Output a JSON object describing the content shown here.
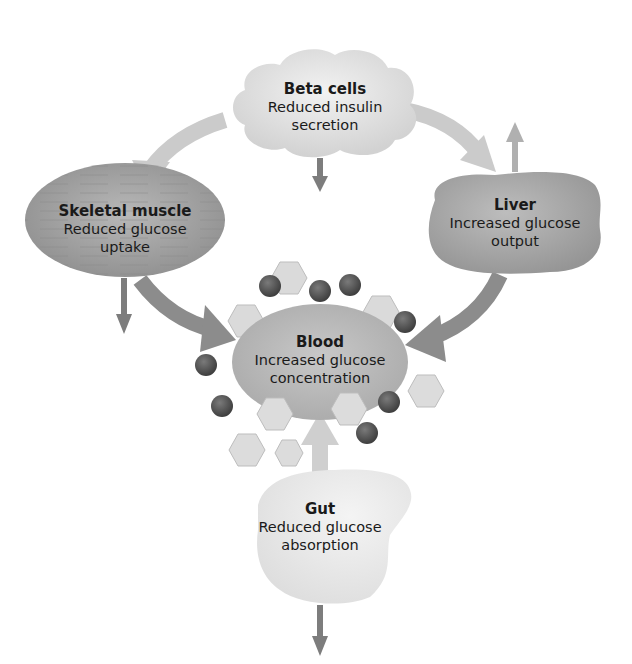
{
  "diagram": {
    "nodes": {
      "beta_cells": {
        "title": "Beta cells",
        "desc_line1": "Reduced insulin",
        "desc_line2": "secretion"
      },
      "skeletal_muscle": {
        "title": "Skeletal muscle",
        "desc_line1": "Reduced glucose",
        "desc_line2": "uptake"
      },
      "liver": {
        "title": "Liver",
        "desc_line1": "Increased glucose",
        "desc_line2": "output"
      },
      "blood": {
        "title": "Blood",
        "desc_line1": "Increased glucose",
        "desc_line2": "concentration"
      },
      "gut": {
        "title": "Gut",
        "desc_line1": "Reduced glucose",
        "desc_line2": "absorption"
      }
    },
    "edges": [
      {
        "from": "beta_cells",
        "to": "skeletal_muscle"
      },
      {
        "from": "beta_cells",
        "to": "liver"
      },
      {
        "from": "skeletal_muscle",
        "to": "blood"
      },
      {
        "from": "liver",
        "to": "blood"
      },
      {
        "from": "gut",
        "to": "blood"
      }
    ],
    "indicators": {
      "beta_cells": "down",
      "skeletal_muscle": "down",
      "liver": "up",
      "gut": "down"
    },
    "colors": {
      "light_arrow": "#c9c9c9",
      "dark_arrow": "#8a8a8a",
      "small_arrow": "#7d7d7d",
      "molecule_dark": "#5a5a5a",
      "molecule_hex": "#d9d9d9",
      "node_fill": "#bdbdbd"
    }
  }
}
